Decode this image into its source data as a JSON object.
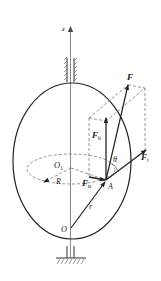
{
  "diagram": {
    "labels": {
      "z_axis": "z",
      "force": "F",
      "force_b": {
        "main": "F",
        "sub": "b"
      },
      "force_t": {
        "main": "F",
        "sub": "t"
      },
      "force_n": {
        "main": "F",
        "sub": "n"
      },
      "angle": "θ",
      "origin": "O",
      "center": {
        "main": "O",
        "sub": "1"
      },
      "radius": "R",
      "position": "r",
      "point": "A"
    },
    "colors": {
      "line": "#222222",
      "axis": "#888888",
      "dashed": "#666666"
    }
  }
}
